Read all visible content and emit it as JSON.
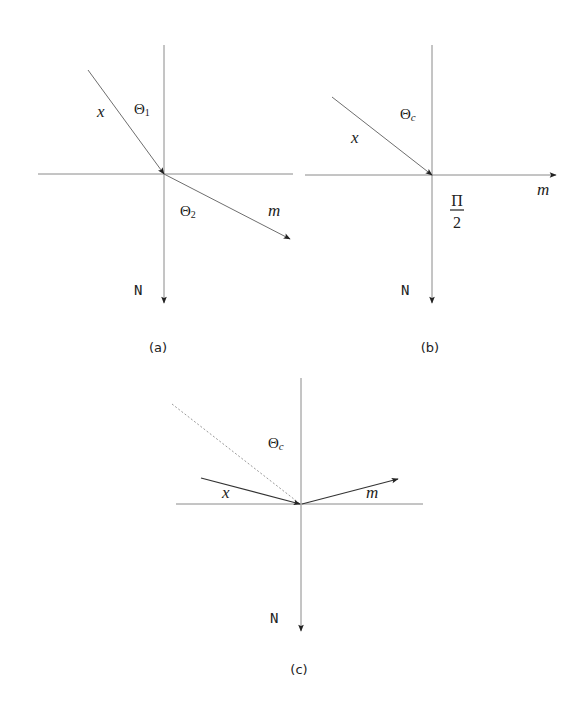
{
  "diagram": {
    "panels": [
      {
        "id": "a",
        "caption": "(a)",
        "labels": {
          "incident": "x",
          "refracted": "m",
          "normal": "N",
          "angle1": "Θ",
          "angle1_sub": "1",
          "angle2": "Θ",
          "angle2_sub": "2"
        }
      },
      {
        "id": "b",
        "caption": "(b)",
        "labels": {
          "incident": "x",
          "refracted": "m",
          "normal": "N",
          "critical_angle": "Θ",
          "critical_angle_sub": "c",
          "right_angle_num": "Π",
          "right_angle_den": "2"
        }
      },
      {
        "id": "c",
        "caption": "(c)",
        "labels": {
          "incident": "x",
          "reflected": "m",
          "normal": "N",
          "critical_angle": "Θ",
          "critical_angle_sub": "c"
        }
      }
    ],
    "colors": {
      "axis": "#8a8a8a",
      "ray": "#6e6e6e",
      "ray_dark": "#333333",
      "dashed": "#9a9a9a",
      "text": "#222222"
    }
  }
}
